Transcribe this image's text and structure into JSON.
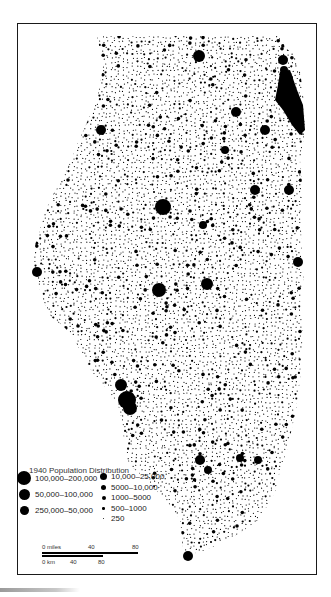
{
  "map": {
    "title": "1940 Population Distribution",
    "region_shape": "illinois-state-outline",
    "dot_color": "#000000",
    "background_color": "#ffffff"
  },
  "legend": {
    "title": "1940 Population Distribution",
    "items": [
      {
        "label": "100,000–200,000",
        "size": 14,
        "col": 0
      },
      {
        "label": "50,000–100,000",
        "size": 11,
        "col": 0
      },
      {
        "label": "250,000–50,000",
        "size": 9,
        "col": 0
      },
      {
        "label": "10,000–25,000",
        "size": 7,
        "col": 1
      },
      {
        "label": "5000–10,000",
        "size": 5,
        "col": 1
      },
      {
        "label": "1000–5000",
        "size": 4,
        "col": 1
      },
      {
        "label": "500–1000",
        "size": 2.5,
        "col": 1
      },
      {
        "label": "250",
        "size": 1.8,
        "col": 1
      }
    ]
  },
  "scale": {
    "miles_label": "0 miles",
    "miles_ticks": [
      "40",
      "80"
    ],
    "km_label": "0 km",
    "km_ticks": [
      "40",
      "80"
    ]
  }
}
